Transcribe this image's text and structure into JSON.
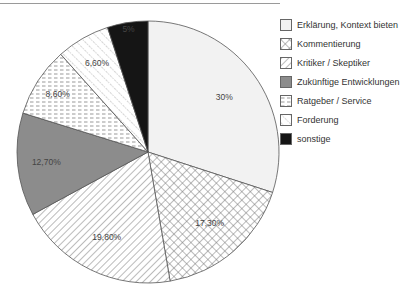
{
  "chart_data": {
    "type": "pie",
    "title": "",
    "start_angle_deg": 0,
    "direction": "clockwise",
    "categories": [
      "Erklärung, Kontext bieten",
      "Kommentierung",
      "Kritiker / Skeptiker",
      "Zukünftige Entwicklungen",
      "Ratgeber / Service",
      "Forderung",
      "sonstige"
    ],
    "values": [
      30,
      17.3,
      19.8,
      12.7,
      8.6,
      6.6,
      5
    ],
    "value_labels": [
      "30%",
      "17,30%",
      "19,80%",
      "12,70%",
      "8,60%",
      "6,60%",
      "5%"
    ],
    "fills": [
      "light-gray",
      "crosshatch",
      "diagonal-forward",
      "solid-gray",
      "horizontal-dashes",
      "diagonal-back-dotted",
      "solid-black"
    ],
    "colors": {
      "light-gray": "#f2f2f2",
      "solid-gray": "#8c8c8c",
      "solid-black": "#151515",
      "pattern-stroke": "#777777",
      "outline": "#555555"
    },
    "legend_position": "right",
    "grid": false
  },
  "legend": {
    "items": [
      {
        "label": "Erklärung, Kontext bieten"
      },
      {
        "label": "Kommentierung"
      },
      {
        "label": "Kritiker / Skeptiker"
      },
      {
        "label": "Zukünftige Entwicklungen"
      },
      {
        "label": "Ratgeber / Service"
      },
      {
        "label": "Forderung"
      },
      {
        "label": "sonstige"
      }
    ]
  }
}
